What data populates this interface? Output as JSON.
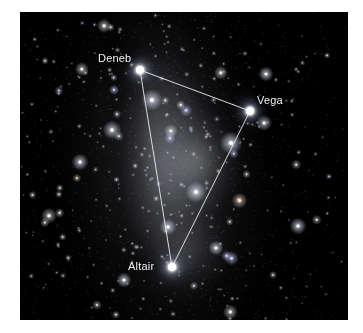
{
  "image": {
    "alt_title": "Summer Triangle asterism over the Milky Way",
    "frame": {
      "x": 20,
      "y": 12,
      "width": 328,
      "height": 308
    },
    "background_color": "#000000",
    "page_background_color": "#ffffff",
    "line_color": "#e9eaee",
    "star_color": "#ffffff",
    "label_color": "#f2f3f6"
  },
  "chart_data": {
    "type": "scatter",
    "xlabel": "",
    "ylabel": "",
    "xlim": [
      0,
      328
    ],
    "ylim": [
      0,
      308
    ],
    "grid": false,
    "legend": "none",
    "annotations": [
      "Deneb",
      "Vega",
      "Altair"
    ],
    "series": [
      {
        "name": "Summer Triangle stars",
        "points": [
          {
            "label": "Deneb",
            "x": 120,
            "y": 58,
            "label_x": 78,
            "label_y": 40,
            "size": 8
          },
          {
            "label": "Vega",
            "x": 230,
            "y": 99,
            "label_x": 237,
            "label_y": 82,
            "size": 8
          },
          {
            "label": "Altair",
            "x": 152,
            "y": 255,
            "label_x": 108,
            "label_y": 248,
            "size": 8
          }
        ]
      }
    ],
    "edges": [
      {
        "from": "Deneb",
        "to": "Vega"
      },
      {
        "from": "Vega",
        "to": "Altair"
      },
      {
        "from": "Altair",
        "to": "Deneb"
      }
    ]
  },
  "stars": {
    "named": [
      {
        "id": "deneb",
        "name": "Deneb",
        "x": 120,
        "y": 58,
        "label_x": 78,
        "label_y": 40
      },
      {
        "id": "vega",
        "name": "Vega",
        "x": 230,
        "y": 99,
        "label_x": 237,
        "label_y": 82
      },
      {
        "id": "altair",
        "name": "Altair",
        "x": 152,
        "y": 255,
        "label_x": 108,
        "label_y": 248
      }
    ],
    "bright_unnamed": [
      {
        "x": 132,
        "y": 88,
        "r": 2.4
      },
      {
        "x": 211,
        "y": 131,
        "r": 2.6
      },
      {
        "x": 176,
        "y": 180,
        "r": 2.4
      },
      {
        "x": 148,
        "y": 215,
        "r": 1.9
      },
      {
        "x": 92,
        "y": 118,
        "r": 2.1
      },
      {
        "x": 60,
        "y": 150,
        "r": 1.9
      },
      {
        "x": 246,
        "y": 62,
        "r": 1.7
      },
      {
        "x": 278,
        "y": 214,
        "r": 1.9
      },
      {
        "x": 104,
        "y": 268,
        "r": 1.7
      },
      {
        "x": 196,
        "y": 236,
        "r": 1.7
      }
    ],
    "field_count": 520,
    "seed": 20240817
  }
}
